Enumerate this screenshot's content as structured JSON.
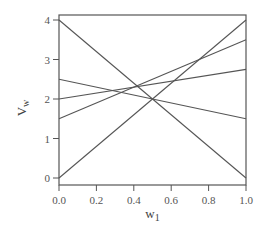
{
  "chart_data": {
    "type": "line",
    "title": "",
    "xlabel": "w",
    "xlabel_sub": "1",
    "ylabel": "V",
    "ylabel_sub": "w",
    "xlim": [
      0.0,
      1.0
    ],
    "ylim": [
      0,
      4
    ],
    "grid": false,
    "legend": null,
    "x_ticks": [
      "0.0",
      "0.2",
      "0.4",
      "0.6",
      "0.8",
      "1.0"
    ],
    "y_ticks": [
      "0",
      "1",
      "2",
      "3",
      "4"
    ],
    "x": [
      0.0,
      1.0
    ],
    "series": [
      {
        "name": "line-1",
        "values": [
          4.0,
          0.0
        ]
      },
      {
        "name": "line-2",
        "values": [
          2.5,
          1.5
        ]
      },
      {
        "name": "line-3",
        "values": [
          2.0,
          2.75
        ]
      },
      {
        "name": "line-4",
        "values": [
          1.5,
          3.5
        ]
      },
      {
        "name": "line-5",
        "values": [
          0.0,
          4.0
        ]
      }
    ],
    "colors": {
      "line": "#555555",
      "axis": "#555555",
      "text": "#555555"
    }
  }
}
